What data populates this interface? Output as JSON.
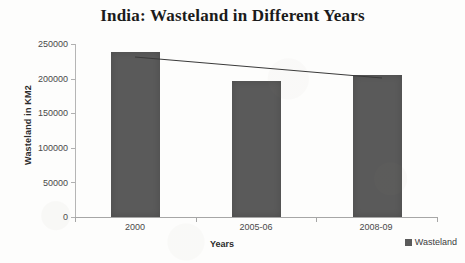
{
  "chart_data": {
    "type": "bar",
    "title": "India: Wasteland in Different Years",
    "xlabel": "Years",
    "ylabel": "Wasteland in KM2",
    "categories": [
      "2000",
      "2005-06",
      "2008-09"
    ],
    "values": [
      239000,
      196500,
      205000
    ],
    "series": [
      {
        "name": "Wasteland",
        "values": [
          239000,
          196500,
          205000
        ]
      }
    ],
    "ylim": [
      0,
      250000
    ],
    "ytick_labels": [
      "0",
      "50000",
      "100000",
      "150000",
      "200000",
      "250000"
    ],
    "ytick_values": [
      0,
      50000,
      100000,
      150000,
      200000,
      250000
    ],
    "grid": false,
    "legend_position": "bottom-right",
    "legend_entries": [
      "Wasteland"
    ],
    "annotations": [
      {
        "name": "trend-line",
        "description": "declining straight line drawn across the tops of the bars",
        "from": {
          "x": "2000",
          "y": 232000
        },
        "to": {
          "x": "2008-09",
          "y": 202000
        }
      }
    ],
    "bar_color": "#5a5a5a",
    "axis_color": "#a6a6a6",
    "trend_line_color": "#3a3a3a"
  },
  "legend": {
    "swatch_name": "wasteland-swatch",
    "label": "Wasteland"
  }
}
